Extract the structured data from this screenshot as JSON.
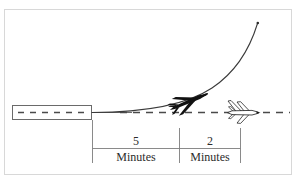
{
  "figure": {
    "frame": {
      "border_color": "#d8d8d8",
      "background_color": "#ffffff"
    },
    "colors": {
      "line": "#5a5a5a",
      "dashed_reference": "#4a4a4a",
      "curve": "#3a3a3a",
      "aircraft_filled": "#111111",
      "aircraft_outline": "#1a1a1a",
      "text": "#2b2b2b",
      "dimension_line": "#777777"
    },
    "runway": {
      "name": "runway-block",
      "centerline_style": "dashed"
    },
    "reference_line": {
      "name": "ground-track-reference",
      "style": "dashed",
      "label": ""
    },
    "climb_path": {
      "name": "climb-trajectory",
      "style": "solid-curve",
      "endpoint_marker": "dot"
    },
    "aircraft": [
      {
        "id": "climbing-aircraft",
        "fill": "filled",
        "attitude": "climbing",
        "label": ""
      },
      {
        "id": "following-aircraft",
        "fill": "outline",
        "attitude": "level",
        "label": ""
      }
    ],
    "dimension_bar": {
      "name": "time-separation-scale",
      "segments": [
        {
          "value": "5",
          "unit": "Minutes"
        },
        {
          "value": "2",
          "unit": "Minutes"
        }
      ]
    },
    "ghost_caption": ""
  }
}
